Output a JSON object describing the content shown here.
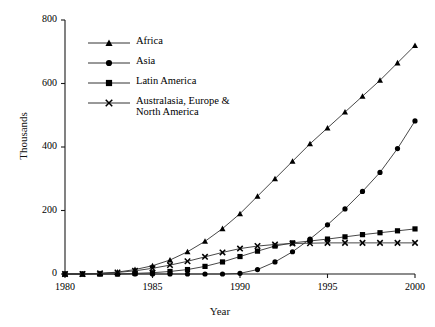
{
  "chart_data": {
    "type": "line",
    "title": "",
    "xlabel": "Year",
    "ylabel": "Thousands",
    "xlim": [
      1980,
      2000
    ],
    "ylim": [
      0,
      800
    ],
    "xticks": [
      1980,
      1985,
      1990,
      1995,
      2000
    ],
    "yticks": [
      0,
      200,
      400,
      600,
      800
    ],
    "grid": false,
    "legend_position": "upper left",
    "x": [
      1980,
      1981,
      1982,
      1983,
      1984,
      1985,
      1986,
      1987,
      1988,
      1989,
      1990,
      1991,
      1992,
      1993,
      1994,
      1995,
      1996,
      1997,
      1998,
      1999,
      2000
    ],
    "series": [
      {
        "name": "Africa",
        "marker": "triangle",
        "values": [
          0,
          0,
          2,
          6,
          14,
          26,
          44,
          70,
          103,
          143,
          190,
          245,
          300,
          355,
          410,
          460,
          510,
          560,
          610,
          665,
          720
        ]
      },
      {
        "name": "Asia",
        "marker": "circle",
        "values": [
          0,
          0,
          0,
          0,
          0,
          0,
          0,
          0,
          0,
          0,
          2,
          14,
          38,
          70,
          110,
          155,
          205,
          260,
          320,
          395,
          482
        ]
      },
      {
        "name": "Latin America",
        "marker": "square",
        "values": [
          0,
          0,
          0,
          0,
          2,
          4,
          8,
          14,
          24,
          38,
          55,
          72,
          88,
          98,
          104,
          110,
          117,
          124,
          130,
          136,
          142
        ]
      },
      {
        "name": "Australasia, Europe &\nNorth America",
        "marker": "cross",
        "values": [
          0,
          0,
          2,
          5,
          10,
          18,
          28,
          40,
          54,
          68,
          80,
          88,
          93,
          96,
          97,
          98,
          98,
          98,
          98,
          98,
          98
        ]
      }
    ]
  }
}
